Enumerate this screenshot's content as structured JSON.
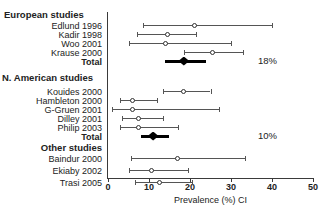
{
  "chart_data": {
    "type": "forest",
    "title": "",
    "xlabel": "Prevalence (%) CI",
    "ylabel": "",
    "xlim": [
      0,
      50
    ],
    "xticks": [
      0,
      10,
      20,
      30,
      40,
      50
    ],
    "xtick_labels": [
      "0",
      "10",
      "20",
      "30",
      "40",
      "50"
    ],
    "grid": false,
    "legend": "none",
    "groups": [
      {
        "name": "European studies",
        "pooled_label": "18%",
        "studies": [
          {
            "label": "Edlund 1996",
            "estimate": 21.0,
            "ci_low": 8.5,
            "ci_high": 40.0
          },
          {
            "label": "Kadir 1998",
            "estimate": 14.5,
            "ci_low": 7.0,
            "ci_high": 21.5
          },
          {
            "label": "Woo 2001",
            "estimate": 14.0,
            "ci_low": 5.0,
            "ci_high": 30.0
          },
          {
            "label": "Krause 2000",
            "estimate": 25.5,
            "ci_low": 18.5,
            "ci_high": 33.0
          }
        ],
        "total": {
          "label": "Total",
          "estimate": 18.5,
          "ci_low": 14.0,
          "ci_high": 24.0
        }
      },
      {
        "name": "N. American studies",
        "pooled_label": "10%",
        "studies": [
          {
            "label": "Kouides 2000",
            "estimate": 18.5,
            "ci_low": 13.5,
            "ci_high": 25.0
          },
          {
            "label": "Hambleton 2000",
            "estimate": 6.0,
            "ci_low": 3.0,
            "ci_high": 12.0
          },
          {
            "label": "G-Gruen 2001",
            "estimate": 6.0,
            "ci_low": 1.0,
            "ci_high": 27.0
          },
          {
            "label": "Dilley 2001",
            "estimate": 7.5,
            "ci_low": 3.5,
            "ci_high": 13.5
          },
          {
            "label": "Philip 2003",
            "estimate": 7.5,
            "ci_low": 3.0,
            "ci_high": 17.0
          }
        ],
        "total": {
          "label": "Total",
          "estimate": 11.0,
          "ci_low": 8.0,
          "ci_high": 15.0
        }
      },
      {
        "name": "Other studies",
        "pooled_label": "",
        "studies": [
          {
            "label": "Baindur 2000",
            "estimate": 17.0,
            "ci_low": 5.5,
            "ci_high": 33.5
          },
          {
            "label": "Ekiaby 2002",
            "estimate": 10.5,
            "ci_low": 5.0,
            "ci_high": 19.5
          },
          {
            "label": "Trasi 2005",
            "estimate": 12.5,
            "ci_low": 6.5,
            "ci_high": 20.5
          }
        ],
        "total": null
      }
    ]
  },
  "labels": {
    "group_european": "European studies",
    "group_namerican": "N. American studies",
    "group_other": "Other studies",
    "study_edlund": "Edlund 1996",
    "study_kadir": "Kadir 1998",
    "study_woo": "Woo 2001",
    "study_krause": "Krause 2000",
    "total_european": "Total",
    "study_kouides": "Kouides 2000",
    "study_hambleton": "Hambleton 2000",
    "study_ggruen": "G-Gruen 2001",
    "study_dilley": "Dilley 2001",
    "study_philip": "Philip 2003",
    "total_namerican": "Total",
    "study_baindur": "Baindur 2000",
    "study_ekiaby": "Ekiaby 2002",
    "study_trasi": "Trasi 2005"
  },
  "annotations": {
    "pct_european": "18%",
    "pct_namerican": "10%"
  },
  "axis": {
    "title": "Prevalence (%) CI",
    "tick_0": "0",
    "tick_10": "10",
    "tick_20": "20",
    "tick_30": "30",
    "tick_40": "40",
    "tick_50": "50"
  },
  "colors": {
    "line": "#555555",
    "marker_fill": "#ffffff",
    "marker_stroke": "#333333",
    "summary": "#000000",
    "axis": "#3a3a3a",
    "text": "#222222"
  }
}
